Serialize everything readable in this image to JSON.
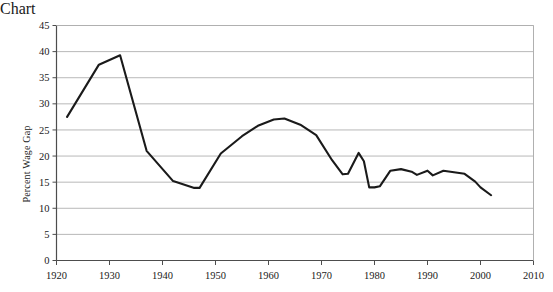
{
  "chart_data": {
    "type": "line",
    "title": "",
    "subtitle": "",
    "xlabel": "",
    "ylabel": "Percent Wage Gap",
    "xlim": [
      1920,
      2010
    ],
    "ylim": [
      0,
      45
    ],
    "xticks": [
      1920,
      1930,
      1940,
      1950,
      1960,
      1970,
      1980,
      1990,
      2000,
      2010
    ],
    "yticks": [
      0,
      5,
      10,
      15,
      20,
      25,
      30,
      35,
      40,
      45
    ],
    "grid": "horizontal-only",
    "legend": "none",
    "series": [
      {
        "name": "Percent Wage Gap",
        "color": "#1a1a1a",
        "x": [
          1922,
          1928,
          1932,
          1937,
          1942,
          1946,
          1947,
          1951,
          1955,
          1958,
          1961,
          1963,
          1966,
          1969,
          1972,
          1974,
          1975,
          1977,
          1978,
          1979,
          1980,
          1981,
          1983,
          1985,
          1987,
          1988,
          1990,
          1991,
          1993,
          1995,
          1997,
          1999,
          2000,
          2002
        ],
        "y": [
          27.5,
          37.5,
          39.3,
          21.0,
          15.2,
          13.9,
          13.9,
          20.5,
          23.8,
          25.8,
          27.0,
          27.2,
          26.0,
          24.0,
          19.2,
          16.5,
          16.6,
          20.6,
          19.0,
          14.0,
          14.0,
          14.2,
          17.2,
          17.5,
          17.0,
          16.4,
          17.2,
          16.3,
          17.2,
          16.9,
          16.6,
          15.1,
          14.0,
          12.5
        ]
      }
    ]
  },
  "axes": {
    "y_tick_labels": [
      "45",
      "40",
      "35",
      "30",
      "25",
      "20",
      "15",
      "10",
      "5",
      "0"
    ],
    "x_tick_labels": [
      "1920",
      "1930",
      "1940",
      "1950",
      "1960",
      "1970",
      "1980",
      "1990",
      "2000",
      "2010"
    ],
    "y_axis_title": "Percent Wage Gap"
  },
  "style": {
    "line_color": "#1a1a1a",
    "grid_color": "#b0b0b0",
    "axis_color": "#4d4d4d",
    "background": "#ffffff"
  }
}
